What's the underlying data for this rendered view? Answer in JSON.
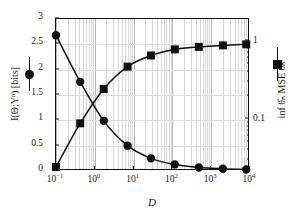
{
  "chart_data": {
    "type": "line",
    "title": "",
    "xlabel": "D",
    "xscale": "log",
    "xlim": [
      0.1,
      10000
    ],
    "xticks": [
      "10⁻¹",
      "10⁰",
      "10¹",
      "10²",
      "10³",
      "10⁴"
    ],
    "xtick_values": [
      0.1,
      1,
      10,
      100,
      1000,
      10000
    ],
    "grid": true,
    "legend_position": "axis-labels",
    "left_axis": {
      "label": "I(Θ;Yⁿ) [bits]",
      "label_plain": "I(Theta;Y^n) [bits]",
      "scale": "linear",
      "ylim": [
        0,
        3
      ],
      "yticks": [
        "0",
        "0.5",
        "1",
        "1.5",
        "2",
        "2.5",
        "3"
      ],
      "ytick_values": [
        0,
        0.5,
        1,
        1.5,
        2,
        2.5,
        3
      ],
      "marker": "circle"
    },
    "right_axis": {
      "label": "inf θ̂ₙ MSE θ̂ₙ",
      "label_plain": "inf_{theta-hat_n} MSE_{theta-hat_n}",
      "scale": "log",
      "ylim": [
        0.02,
        1.6
      ],
      "yticks": [
        "1",
        "0.1"
      ],
      "ytick_values": [
        1,
        0.1
      ],
      "marker": "square"
    },
    "series": [
      {
        "name": "I(Θ;Yⁿ) [bits]",
        "axis": "left",
        "marker": "circle",
        "x": [
          0.1,
          0.42,
          1.7,
          7.0,
          28,
          115,
          480,
          2000,
          8000
        ],
        "y": [
          2.68,
          1.76,
          0.99,
          0.5,
          0.25,
          0.13,
          0.07,
          0.045,
          0.03
        ]
      },
      {
        "name": "inf θ̂ₙ MSE θ̂ₙ",
        "axis": "right",
        "marker": "square",
        "x": [
          0.1,
          0.42,
          1.7,
          7.0,
          28,
          115,
          480,
          2000,
          8000
        ],
        "y_left_equiv": [
          0.08,
          0.94,
          1.62,
          2.06,
          2.28,
          2.4,
          2.45,
          2.48,
          2.5
        ],
        "y": [
          0.072,
          0.175,
          0.3,
          0.45,
          0.57,
          0.65,
          0.7,
          0.73,
          0.75
        ]
      }
    ]
  },
  "legend": {
    "left_marker_name": "circle-marker",
    "right_marker_name": "square-marker"
  },
  "colors": {
    "ink": "#111111",
    "grid_minor": "#d8d8d8",
    "grid_major": "#b9b9b9",
    "background": "#ffffff"
  }
}
